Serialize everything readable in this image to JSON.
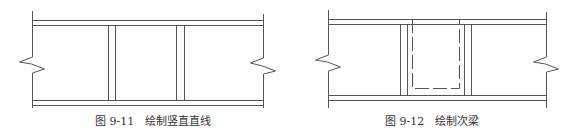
{
  "colors": {
    "line": "#555555",
    "caption": "#333333",
    "background": "#ffffff"
  },
  "figures": [
    {
      "id": "fig-9-11",
      "caption": "图 9-11　绘制竖直直线",
      "caption_pos": [
        95,
        116
      ],
      "frame": {
        "left_x": 32,
        "right_x": 263,
        "top_y1": 20,
        "top_y2": 25,
        "bot_y1": 100,
        "bot_y2": 105,
        "vert_top": 11,
        "vert_bot": 108
      },
      "break_left": [
        [
          32,
          11
        ],
        [
          32,
          57
        ],
        [
          19,
          62
        ],
        [
          31,
          64
        ],
        [
          44,
          69
        ],
        [
          32,
          73
        ],
        [
          32,
          108
        ]
      ],
      "break_right": [
        [
          263,
          14
        ],
        [
          263,
          58
        ],
        [
          250,
          63
        ],
        [
          262,
          66
        ],
        [
          275,
          71
        ],
        [
          263,
          74
        ],
        [
          263,
          108
        ]
      ],
      "vertical_pairs": [
        [
          108,
          115
        ],
        [
          176,
          184
        ]
      ],
      "dashed_rect": null
    },
    {
      "id": "fig-9-12",
      "caption": "图 9-12　绘制次梁",
      "caption_pos": [
        385,
        116
      ],
      "frame": {
        "left_x": 328,
        "right_x": 546,
        "top_y1": 19,
        "top_y2": 24,
        "bot_y1": 95,
        "bot_y2": 100,
        "vert_top": 10,
        "vert_bot": 108
      },
      "break_left": [
        [
          328,
          10
        ],
        [
          328,
          55
        ],
        [
          315,
          60
        ],
        [
          327,
          62
        ],
        [
          340,
          67
        ],
        [
          328,
          71
        ],
        [
          328,
          108
        ]
      ],
      "break_right": [
        [
          546,
          12
        ],
        [
          546,
          57
        ],
        [
          533,
          62
        ],
        [
          545,
          64
        ],
        [
          558,
          69
        ],
        [
          546,
          72
        ],
        [
          546,
          108
        ]
      ],
      "vertical_pairs": [
        [
          400,
          407
        ],
        [
          464,
          471
        ]
      ],
      "dashed_rect": {
        "x1": 412,
        "y1": 19,
        "x2": 459,
        "y2": 88
      }
    }
  ]
}
